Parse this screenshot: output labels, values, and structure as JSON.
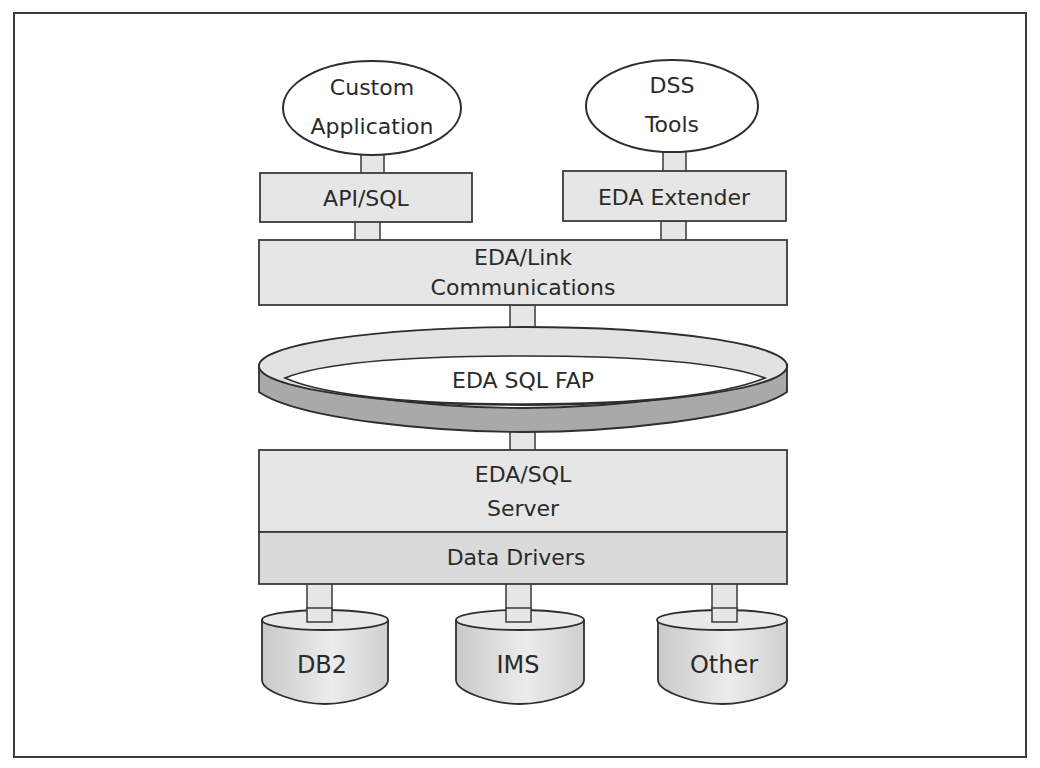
{
  "diagram": {
    "colors": {
      "box_fill": "#e6e6e6",
      "drivers_fill": "#dadada",
      "stroke": "#3a3a3a",
      "ring_top": "#e2e2e2",
      "ring_side": "#a9a9a9",
      "cylinder_fill": "#dcdcdc"
    },
    "clients": [
      {
        "id": "custom-application",
        "line1": "Custom",
        "line2": "Application"
      },
      {
        "id": "dss-tools",
        "line1": "DSS",
        "line2": "Tools"
      }
    ],
    "interfaces": [
      {
        "id": "api-sql",
        "label": "API/SQL"
      },
      {
        "id": "eda-extender",
        "label": "EDA Extender"
      }
    ],
    "link_layer": {
      "line1": "EDA/Link",
      "line2": "Communications"
    },
    "protocol_ring": {
      "label": "EDA SQL FAP"
    },
    "server": {
      "line1": "EDA/SQL",
      "line2": "Server"
    },
    "drivers": {
      "label": "Data Drivers"
    },
    "databases": [
      {
        "id": "db2",
        "label": "DB2"
      },
      {
        "id": "ims",
        "label": "IMS"
      },
      {
        "id": "other",
        "label": "Other"
      }
    ]
  }
}
